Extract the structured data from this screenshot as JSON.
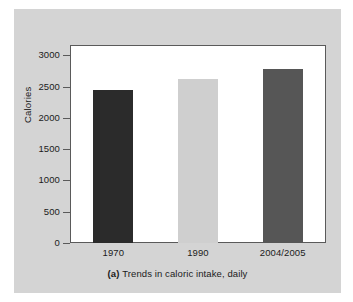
{
  "figure": {
    "caption_tag": "(a)",
    "caption_text": "Trends in caloric intake, daily",
    "card_color": "#d4d4d4",
    "panel_color": "#ffffff",
    "panel_border_color": "#5a5a5a",
    "text_color": "#1b1b1b"
  },
  "chart_data": {
    "type": "bar",
    "title": "",
    "subtitle": "",
    "xlabel": "",
    "ylabel": "Calories",
    "categories": [
      "1970",
      "1990",
      "2004/2005"
    ],
    "values": [
      2450,
      2630,
      2775
    ],
    "bar_colors": [
      "#2b2b2b",
      "#cfcfcf",
      "#565656"
    ],
    "ylim": [
      0,
      3150
    ],
    "yticks": [
      0,
      500,
      1000,
      1500,
      2000,
      2500,
      3000
    ],
    "ytick_labels": [
      "0",
      "500",
      "1000",
      "1500",
      "2000",
      "2500",
      "3000"
    ],
    "grid": false,
    "legend": false,
    "legend_position": "none"
  }
}
